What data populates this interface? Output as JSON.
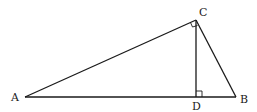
{
  "diagram": {
    "points": {
      "A": {
        "label": "A",
        "x": 25,
        "y": 97
      },
      "B": {
        "label": "B",
        "x": 236,
        "y": 97
      },
      "C": {
        "label": "C",
        "x": 196,
        "y": 20
      },
      "D": {
        "label": "D",
        "x": 196,
        "y": 97
      }
    },
    "segments": [
      "AB",
      "AC",
      "BC",
      "CD"
    ],
    "right_angles": [
      "ACB",
      "CDB"
    ],
    "colors": {
      "stroke": "#1a1a1a",
      "background": "#ffffff"
    }
  }
}
